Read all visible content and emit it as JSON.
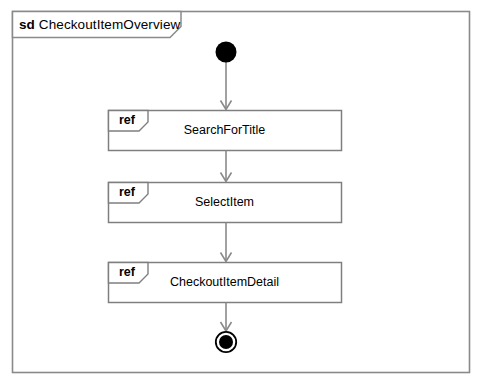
{
  "diagram": {
    "type": "uml-sequence-diagram-overview",
    "frame": {
      "keyword": "sd",
      "name": "CheckoutItemOverview",
      "title_full": "sd CheckoutItemOverview"
    },
    "nodes": {
      "initial": {
        "name": "initial-node",
        "shape": "filled-circle"
      },
      "final": {
        "name": "final-node",
        "shape": "bullseye-circle"
      }
    },
    "fragments": [
      {
        "keyword": "ref",
        "label": "SearchForTitle"
      },
      {
        "keyword": "ref",
        "label": "SelectItem"
      },
      {
        "keyword": "ref",
        "label": "CheckoutItemDetail"
      }
    ],
    "flows": [
      {
        "from": "initial-node",
        "to": "SearchForTitle"
      },
      {
        "from": "SearchForTitle",
        "to": "SelectItem"
      },
      {
        "from": "SelectItem",
        "to": "CheckoutItemDetail"
      },
      {
        "from": "CheckoutItemDetail",
        "to": "final-node"
      }
    ],
    "colors": {
      "frame_border": "#8a8a8a",
      "fragment_border": "#7f7f7f",
      "flow_line": "#8a8a8a",
      "node_fill": "#000000",
      "background": "#ffffff",
      "text": "#000000"
    }
  }
}
